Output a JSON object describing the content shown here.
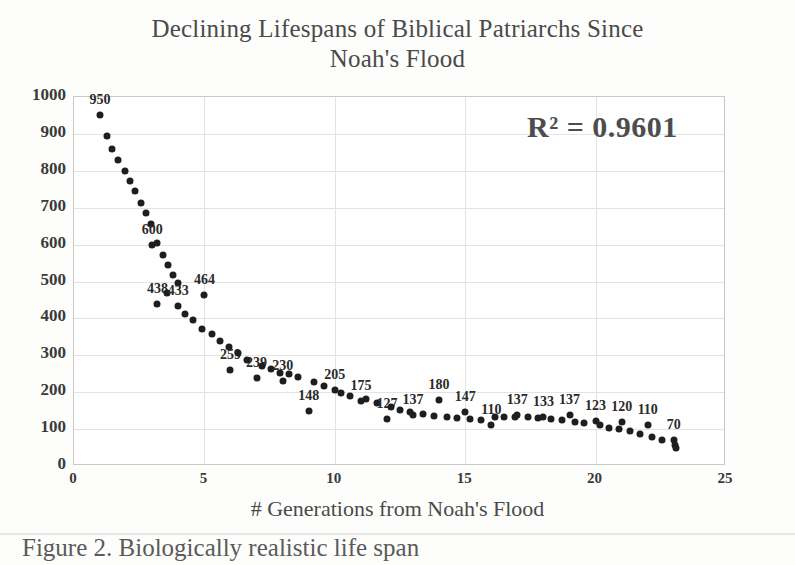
{
  "chart_data": {
    "type": "scatter",
    "title": "Declining Lifespans of Biblical Patriarchs Since Noah's Flood",
    "title_line1": "Declining Lifespans of Biblical Patriarchs Since",
    "title_line2": "Noah's Flood",
    "xlabel": "# Generations from Noah's Flood",
    "ylabel": "",
    "xlim": [
      0,
      25
    ],
    "ylim": [
      0,
      1000
    ],
    "xticks": [
      0,
      5,
      10,
      15,
      20,
      25
    ],
    "yticks": [
      0,
      100,
      200,
      300,
      400,
      500,
      600,
      700,
      800,
      900,
      1000
    ],
    "grid": true,
    "legend": "none",
    "annotation": "R² = 0.9601",
    "marker_color": "#1e1e1e",
    "points": [
      {
        "x": 1.0,
        "y": 950,
        "label": "950"
      },
      {
        "x": 1.25,
        "y": 895,
        "label": ""
      },
      {
        "x": 1.45,
        "y": 860,
        "label": ""
      },
      {
        "x": 1.7,
        "y": 830,
        "label": ""
      },
      {
        "x": 1.95,
        "y": 800,
        "label": ""
      },
      {
        "x": 2.15,
        "y": 772,
        "label": ""
      },
      {
        "x": 2.35,
        "y": 745,
        "label": ""
      },
      {
        "x": 2.55,
        "y": 712,
        "label": ""
      },
      {
        "x": 2.75,
        "y": 685,
        "label": ""
      },
      {
        "x": 2.95,
        "y": 655,
        "label": ""
      },
      {
        "x": 3.0,
        "y": 600,
        "label": "600"
      },
      {
        "x": 3.2,
        "y": 605,
        "label": ""
      },
      {
        "x": 3.4,
        "y": 572,
        "label": ""
      },
      {
        "x": 3.6,
        "y": 545,
        "label": ""
      },
      {
        "x": 3.8,
        "y": 518,
        "label": ""
      },
      {
        "x": 4.0,
        "y": 495,
        "label": ""
      },
      {
        "x": 3.2,
        "y": 438,
        "label": "438"
      },
      {
        "x": 3.55,
        "y": 470,
        "label": ""
      },
      {
        "x": 4.0,
        "y": 433,
        "label": "433"
      },
      {
        "x": 4.25,
        "y": 412,
        "label": ""
      },
      {
        "x": 4.55,
        "y": 395,
        "label": ""
      },
      {
        "x": 4.9,
        "y": 370,
        "label": ""
      },
      {
        "x": 5.0,
        "y": 464,
        "label": "464"
      },
      {
        "x": 5.3,
        "y": 358,
        "label": ""
      },
      {
        "x": 5.6,
        "y": 340,
        "label": ""
      },
      {
        "x": 5.95,
        "y": 322,
        "label": ""
      },
      {
        "x": 6.0,
        "y": 259,
        "label": "259"
      },
      {
        "x": 6.3,
        "y": 305,
        "label": ""
      },
      {
        "x": 6.65,
        "y": 288,
        "label": ""
      },
      {
        "x": 7.0,
        "y": 239,
        "label": "239"
      },
      {
        "x": 7.2,
        "y": 272,
        "label": ""
      },
      {
        "x": 7.55,
        "y": 262,
        "label": ""
      },
      {
        "x": 7.9,
        "y": 252,
        "label": ""
      },
      {
        "x": 8.0,
        "y": 230,
        "label": "230"
      },
      {
        "x": 8.25,
        "y": 248,
        "label": ""
      },
      {
        "x": 8.6,
        "y": 240,
        "label": ""
      },
      {
        "x": 9.0,
        "y": 148,
        "label": "148"
      },
      {
        "x": 9.2,
        "y": 228,
        "label": ""
      },
      {
        "x": 9.6,
        "y": 218,
        "label": ""
      },
      {
        "x": 10.0,
        "y": 205,
        "label": "205"
      },
      {
        "x": 10.25,
        "y": 198,
        "label": ""
      },
      {
        "x": 10.6,
        "y": 190,
        "label": ""
      },
      {
        "x": 11.0,
        "y": 175,
        "label": "175"
      },
      {
        "x": 11.2,
        "y": 182,
        "label": ""
      },
      {
        "x": 11.6,
        "y": 172,
        "label": ""
      },
      {
        "x": 12.0,
        "y": 127,
        "label": "127"
      },
      {
        "x": 12.15,
        "y": 160,
        "label": ""
      },
      {
        "x": 12.5,
        "y": 152,
        "label": ""
      },
      {
        "x": 12.9,
        "y": 146,
        "label": ""
      },
      {
        "x": 13.0,
        "y": 137,
        "label": "137"
      },
      {
        "x": 13.4,
        "y": 140,
        "label": ""
      },
      {
        "x": 13.8,
        "y": 136,
        "label": ""
      },
      {
        "x": 14.0,
        "y": 180,
        "label": "180"
      },
      {
        "x": 14.3,
        "y": 132,
        "label": ""
      },
      {
        "x": 14.7,
        "y": 130,
        "label": ""
      },
      {
        "x": 15.0,
        "y": 147,
        "label": "147"
      },
      {
        "x": 15.2,
        "y": 128,
        "label": ""
      },
      {
        "x": 15.6,
        "y": 126,
        "label": ""
      },
      {
        "x": 16.0,
        "y": 110,
        "label": "110"
      },
      {
        "x": 16.15,
        "y": 133,
        "label": ""
      },
      {
        "x": 16.5,
        "y": 132,
        "label": ""
      },
      {
        "x": 16.9,
        "y": 134,
        "label": ""
      },
      {
        "x": 17.0,
        "y": 137,
        "label": "137"
      },
      {
        "x": 17.4,
        "y": 132,
        "label": ""
      },
      {
        "x": 17.8,
        "y": 130,
        "label": ""
      },
      {
        "x": 18.0,
        "y": 133,
        "label": "133"
      },
      {
        "x": 18.3,
        "y": 128,
        "label": ""
      },
      {
        "x": 18.7,
        "y": 124,
        "label": ""
      },
      {
        "x": 19.0,
        "y": 137,
        "label": "137"
      },
      {
        "x": 19.2,
        "y": 120,
        "label": ""
      },
      {
        "x": 19.55,
        "y": 116,
        "label": ""
      },
      {
        "x": 20.0,
        "y": 123,
        "label": "123"
      },
      {
        "x": 20.15,
        "y": 110,
        "label": ""
      },
      {
        "x": 20.5,
        "y": 104,
        "label": ""
      },
      {
        "x": 20.9,
        "y": 100,
        "label": ""
      },
      {
        "x": 21.0,
        "y": 120,
        "label": "120"
      },
      {
        "x": 21.3,
        "y": 94,
        "label": ""
      },
      {
        "x": 21.7,
        "y": 86,
        "label": ""
      },
      {
        "x": 22.0,
        "y": 110,
        "label": "110"
      },
      {
        "x": 22.15,
        "y": 78,
        "label": ""
      },
      {
        "x": 22.55,
        "y": 70,
        "label": ""
      },
      {
        "x": 23.0,
        "y": 70,
        "label": "70"
      },
      {
        "x": 23.05,
        "y": 58,
        "label": ""
      },
      {
        "x": 23.1,
        "y": 48,
        "label": ""
      }
    ]
  },
  "caption": {
    "text": "Figure 2. Biologically realistic life span"
  }
}
